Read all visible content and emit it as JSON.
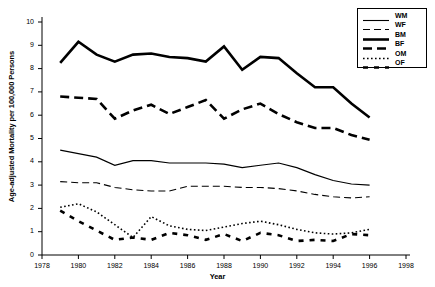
{
  "chart_data": {
    "type": "line",
    "title": "",
    "xlabel": "Year",
    "ylabel": "Age-adjusted Mortality per 100,000 Persons",
    "xlim": [
      1978,
      1998
    ],
    "ylim": [
      0,
      10
    ],
    "xticks": [
      1978,
      1980,
      1982,
      1984,
      1986,
      1988,
      1990,
      1992,
      1994,
      1996,
      1998
    ],
    "yticks": [
      0,
      1,
      2,
      3,
      4,
      5,
      6,
      7,
      8,
      9,
      10
    ],
    "grid": false,
    "legend_position": "top-right",
    "x": [
      1979,
      1980,
      1981,
      1982,
      1983,
      1984,
      1985,
      1986,
      1987,
      1988,
      1989,
      1990,
      1991,
      1992,
      1993,
      1994,
      1995,
      1996
    ],
    "series": [
      {
        "name": "BM",
        "label": "BM",
        "style": "solid-thick",
        "values": [
          8.25,
          9.15,
          8.6,
          8.3,
          8.6,
          8.65,
          8.5,
          8.45,
          8.3,
          8.95,
          7.95,
          8.5,
          8.45,
          7.8,
          7.2,
          7.2,
          6.5,
          5.9
        ]
      },
      {
        "name": "BF",
        "label": "BF",
        "style": "dashed-thick",
        "values": [
          6.8,
          6.75,
          6.7,
          5.85,
          6.2,
          6.45,
          6.05,
          6.35,
          6.65,
          5.85,
          6.25,
          6.5,
          6.05,
          5.7,
          5.45,
          5.45,
          5.15,
          4.95
        ]
      },
      {
        "name": "WM",
        "label": "WM",
        "style": "solid-thin",
        "values": [
          4.5,
          4.35,
          4.2,
          3.85,
          4.05,
          4.05,
          3.95,
          3.95,
          3.95,
          3.9,
          3.75,
          3.85,
          3.95,
          3.75,
          3.45,
          3.2,
          3.05,
          3.0
        ]
      },
      {
        "name": "WF",
        "label": "WF",
        "style": "dashed-thin",
        "values": [
          3.15,
          3.1,
          3.1,
          2.9,
          2.8,
          2.75,
          2.75,
          2.95,
          2.95,
          2.95,
          2.9,
          2.9,
          2.85,
          2.75,
          2.6,
          2.5,
          2.45,
          2.5
        ]
      },
      {
        "name": "OM",
        "label": "OM",
        "style": "dotted",
        "values": [
          2.05,
          2.2,
          1.85,
          1.3,
          0.75,
          1.65,
          1.25,
          1.1,
          1.05,
          1.2,
          1.35,
          1.45,
          1.3,
          1.1,
          0.95,
          0.9,
          0.95,
          1.1
        ]
      },
      {
        "name": "OF",
        "label": "OF",
        "style": "dashed-sparse",
        "values": [
          1.9,
          1.45,
          1.05,
          0.65,
          0.75,
          0.65,
          0.95,
          0.85,
          0.65,
          0.9,
          0.6,
          0.95,
          0.85,
          0.6,
          0.65,
          0.6,
          0.9,
          0.85
        ]
      }
    ]
  },
  "legend": {
    "entries": [
      {
        "label": "WM",
        "style": "solid-thin"
      },
      {
        "label": "WF",
        "style": "dashed-thin"
      },
      {
        "label": "BM",
        "style": "solid-thick"
      },
      {
        "label": "BF",
        "style": "dashed-thick"
      },
      {
        "label": "OM",
        "style": "dotted"
      },
      {
        "label": "OF",
        "style": "dashed-sparse"
      }
    ]
  },
  "colors": {
    "ink": "#000000",
    "background": "#ffffff"
  }
}
